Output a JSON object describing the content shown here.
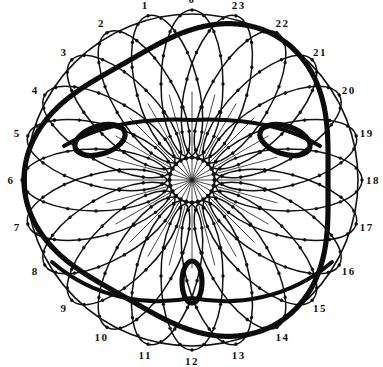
{
  "figure": {
    "kind": "geometric-diagram",
    "background_color": "#ffffff",
    "ink_color": "#111111",
    "center": {
      "x": 192,
      "y": 180
    },
    "outer_radius": 168,
    "divisions": 24,
    "tick_labels": [
      "0",
      "1",
      "2",
      "3",
      "4",
      "5",
      "6",
      "7",
      "8",
      "9",
      "10",
      "11",
      "12",
      "13",
      "14",
      "15",
      "16",
      "17",
      "18",
      "19",
      "20",
      "21",
      "22",
      "23"
    ],
    "label_radius": 181,
    "label_start_angle_deg": -90,
    "label_direction": "counterclockwise",
    "spokes": {
      "count": 24,
      "inner_radius": 0,
      "outer_radius": 88,
      "stroke_width": 0.8,
      "color": "#1a1a1a"
    },
    "petal_ring": {
      "count": 24,
      "description": "overlapping elongated ovals whose centers lie on a circle, each bearing evenly spaced marker dots",
      "center_radius": 96,
      "semi_major": 74,
      "semi_minor": 31,
      "stroke_width": 1.5,
      "dot_count_per_petal": 16,
      "dot_radius": 1.7,
      "color": "#111111"
    },
    "rim_circle": {
      "radius": 166,
      "stroke_width": 1.6,
      "color": "#111111"
    },
    "bold_curve": {
      "description": "heavy highlighted epitrochoid passing through three small cusped loops",
      "stroke_width": 5.2,
      "color": "#0c0c0c",
      "loops": [
        {
          "name": "upper-left-loop",
          "x": 100,
          "y": 140,
          "rx": 26,
          "ry": 14,
          "rotation_deg": -18
        },
        {
          "name": "upper-right-loop",
          "x": 285,
          "y": 140,
          "rx": 26,
          "ry": 14,
          "rotation_deg": 18
        },
        {
          "name": "bottom-center-loop",
          "x": 192,
          "y": 282,
          "rx": 10,
          "ry": 21,
          "rotation_deg": 0
        }
      ]
    }
  },
  "chart_data": {
    "type": "scatter",
    "xlabel": "",
    "ylabel": "",
    "categories": [
      "0",
      "1",
      "2",
      "3",
      "4",
      "5",
      "6",
      "7",
      "8",
      "9",
      "10",
      "11",
      "12",
      "13",
      "14",
      "15",
      "16",
      "17",
      "18",
      "19",
      "20",
      "21",
      "22",
      "23"
    ],
    "values": [
      0,
      15,
      30,
      45,
      60,
      75,
      90,
      105,
      120,
      135,
      150,
      165,
      180,
      195,
      210,
      225,
      240,
      255,
      270,
      285,
      300,
      315,
      330,
      345
    ],
    "legend": [],
    "grid": false
  }
}
